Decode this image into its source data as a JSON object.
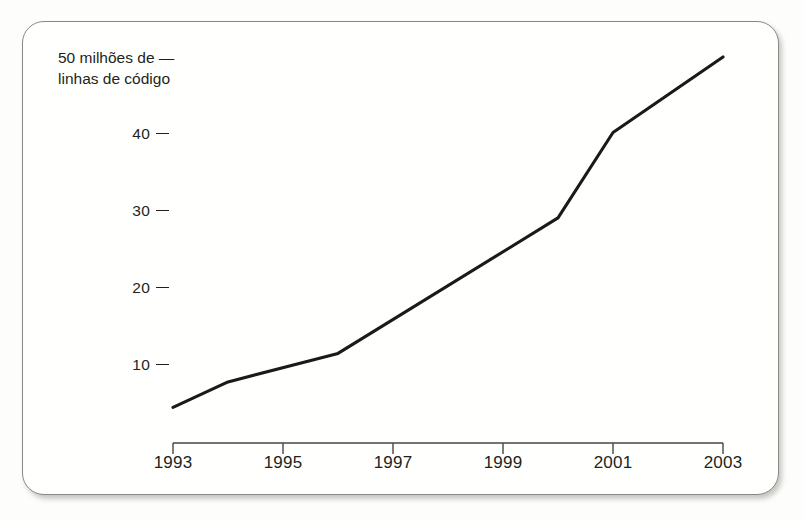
{
  "figure": {
    "caption_lines": [
      "50 milhões de  —",
      "linhas de código"
    ],
    "note_top_value": "50",
    "note_units": "milhões de linhas de código",
    "background_color": "#fdfdfb",
    "card_color": "#fffffd",
    "border_color": "#8b8881",
    "ink_color": "#231f1c"
  },
  "chart_data": {
    "type": "line",
    "title": "",
    "subtitle": "",
    "xlabel": "",
    "ylabel": "50 milhões de linhas de código",
    "x": [
      1993,
      1994,
      1996,
      2000,
      2001,
      2003
    ],
    "values": [
      4.5,
      7.8,
      11.5,
      29.1,
      40.2,
      50
    ],
    "series": [
      {
        "name": "linhas de código",
        "values": [
          4.5,
          7.8,
          11.5,
          29.1,
          40.2,
          50
        ],
        "color": "#1a1a1a"
      }
    ],
    "xlim": [
      1993,
      2003
    ],
    "ylim": [
      0,
      50
    ],
    "xticks": [
      1993,
      1995,
      1997,
      1999,
      2001,
      2003
    ],
    "xticklabels": [
      "1993",
      "1995",
      "1997",
      "1999",
      "2001",
      "2003"
    ],
    "yticks": [
      10,
      20,
      30,
      40,
      50
    ],
    "yticklabels": [
      "10",
      "20",
      "30",
      "40",
      "50"
    ],
    "grid": false,
    "legend": false,
    "legend_position": "none"
  },
  "y_axis": {
    "ticks": [
      {
        "label": "50",
        "value": 50,
        "is_caption_tick": true
      },
      {
        "label": "40",
        "value": 40,
        "is_caption_tick": false
      },
      {
        "label": "30",
        "value": 30,
        "is_caption_tick": false
      },
      {
        "label": "20",
        "value": 20,
        "is_caption_tick": false
      },
      {
        "label": "10",
        "value": 10,
        "is_caption_tick": false
      }
    ]
  },
  "x_axis": {
    "ticks": [
      {
        "label": "1993",
        "value": 1993
      },
      {
        "label": "1995",
        "value": 1995
      },
      {
        "label": "1997",
        "value": 1997
      },
      {
        "label": "1999",
        "value": 1999
      },
      {
        "label": "2001",
        "value": 2001
      },
      {
        "label": "2003",
        "value": 2003
      }
    ]
  }
}
